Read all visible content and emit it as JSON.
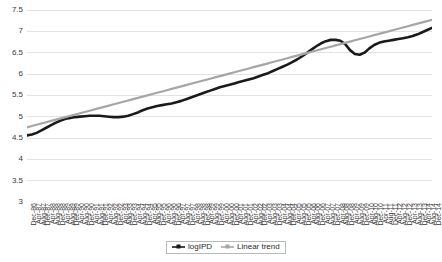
{
  "chart_data": {
    "type": "line",
    "title": "",
    "xlabel": "",
    "ylabel": "",
    "ylim": [
      3,
      7.5
    ],
    "y_ticks": [
      "3",
      "3.5",
      "4",
      "4.5",
      "5",
      "5.5",
      "6",
      "6.5",
      "7",
      "7.5"
    ],
    "y_tick_values": [
      3,
      3.5,
      4,
      4.5,
      5,
      5.5,
      6,
      6.5,
      7,
      7.5
    ],
    "grid": true,
    "legend_position": "bottom",
    "colors": {
      "logIPD": "#1a1a1a",
      "linear_trend": "#a6a6a6",
      "gridline": "#e2e2e2",
      "axis_text": "#3a3a3a"
    },
    "categories": [
      "Dec-86",
      "Apr-87",
      "Aug-87",
      "Dec-87",
      "Apr-88",
      "Aug-88",
      "Dec-88",
      "Apr-89",
      "Aug-89",
      "Dec-89",
      "Apr-90",
      "Aug-90",
      "Dec-90",
      "Apr-91",
      "Aug-91",
      "Dec-91",
      "Apr-92",
      "Aug-92",
      "Dec-92",
      "Apr-93",
      "Aug-93",
      "Dec-93",
      "Apr-94",
      "Aug-94",
      "Dec-94",
      "Apr-95",
      "Aug-95",
      "Dec-95",
      "Apr-96",
      "Aug-96",
      "Dec-96",
      "Apr-97",
      "Aug-97",
      "Dec-97",
      "Apr-98",
      "Aug-98",
      "Dec-98",
      "Apr-99",
      "Aug-99",
      "Dec-99",
      "Apr-00",
      "Aug-00",
      "Dec-00",
      "Apr-01",
      "Aug-01",
      "Dec-01",
      "Apr-02",
      "Aug-02",
      "Dec-02",
      "Apr-03",
      "Aug-03",
      "Dec-03",
      "Apr-04",
      "Aug-04",
      "Dec-04",
      "Apr-05",
      "Aug-05",
      "Dec-05",
      "Apr-06",
      "Aug-06",
      "Dec-06",
      "Apr-07",
      "Aug-07",
      "Dec-07",
      "Apr-08",
      "Aug-08",
      "Dec-08",
      "Apr-09",
      "Aug-09",
      "Dec-09",
      "Apr-10",
      "Aug-10",
      "Dec-10",
      "Apr-11",
      "Aug-11",
      "Dec-11",
      "Apr-12",
      "Aug-12",
      "Dec-12",
      "Apr-13",
      "Aug-13",
      "Dec-13",
      "Apr-14",
      "Aug-14",
      "Dec-14"
    ],
    "x_tick_labels": [
      "Dec-86",
      "Aug-87",
      "Apr-88",
      "Dec-88",
      "Aug-89",
      "Apr-90",
      "Dec-90",
      "Aug-91",
      "Apr-92",
      "Dec-92",
      "Aug-93",
      "Apr-94",
      "Dec-94",
      "Aug-95",
      "Apr-96",
      "Dec-96",
      "Aug-97",
      "Apr-98",
      "Dec-98",
      "Aug-99",
      "Apr-00",
      "Dec-00",
      "Aug-01",
      "Apr-02",
      "Dec-02",
      "Aug-03",
      "Apr-04",
      "Dec-04",
      "Aug-05",
      "Apr-06",
      "Dec-06",
      "Aug-07",
      "Apr-08",
      "Dec-08",
      "Aug-09",
      "Apr-10",
      "Dec-10",
      "Aug-11",
      "Apr-12",
      "Dec-12",
      "Aug-13",
      "Apr-14",
      "Dec-14"
    ],
    "series": [
      {
        "name": "logIPD",
        "color": "#1a1a1a",
        "values": [
          4.56,
          4.58,
          4.62,
          4.68,
          4.74,
          4.8,
          4.86,
          4.91,
          4.95,
          4.97,
          4.99,
          5.0,
          5.01,
          5.02,
          5.02,
          5.02,
          5.01,
          5.0,
          4.99,
          4.99,
          5.0,
          5.02,
          5.06,
          5.1,
          5.15,
          5.19,
          5.22,
          5.25,
          5.27,
          5.29,
          5.31,
          5.34,
          5.37,
          5.41,
          5.45,
          5.49,
          5.53,
          5.57,
          5.61,
          5.65,
          5.69,
          5.72,
          5.75,
          5.78,
          5.81,
          5.84,
          5.87,
          5.9,
          5.94,
          5.98,
          6.02,
          6.07,
          6.12,
          6.17,
          6.22,
          6.28,
          6.34,
          6.41,
          6.49,
          6.57,
          6.65,
          6.72,
          6.77,
          6.8,
          6.8,
          6.78,
          6.7,
          6.56,
          6.47,
          6.45,
          6.5,
          6.6,
          6.68,
          6.73,
          6.76,
          6.78,
          6.8,
          6.82,
          6.84,
          6.86,
          6.89,
          6.93,
          6.98,
          7.03,
          7.08
        ]
      },
      {
        "name": "Linear trend",
        "color": "#a6a6a6",
        "values": [
          4.75,
          4.78,
          4.81,
          4.84,
          4.87,
          4.9,
          4.93,
          4.96,
          4.99,
          5.02,
          5.05,
          5.08,
          5.11,
          5.14,
          5.17,
          5.2,
          5.23,
          5.26,
          5.29,
          5.32,
          5.35,
          5.38,
          5.41,
          5.44,
          5.47,
          5.5,
          5.53,
          5.56,
          5.59,
          5.62,
          5.65,
          5.68,
          5.71,
          5.74,
          5.77,
          5.8,
          5.83,
          5.86,
          5.89,
          5.92,
          5.95,
          5.98,
          6.01,
          6.04,
          6.07,
          6.1,
          6.13,
          6.16,
          6.19,
          6.22,
          6.25,
          6.28,
          6.31,
          6.34,
          6.37,
          6.4,
          6.43,
          6.46,
          6.49,
          6.52,
          6.55,
          6.58,
          6.61,
          6.64,
          6.67,
          6.7,
          6.73,
          6.76,
          6.79,
          6.82,
          6.85,
          6.88,
          6.91,
          6.94,
          6.97,
          7.0,
          7.03,
          7.06,
          7.09,
          7.12,
          7.15,
          7.18,
          7.21,
          7.24,
          7.27
        ]
      }
    ]
  },
  "legend": {
    "entries": [
      {
        "label": "logIPD",
        "marker": "line-marker",
        "color": "#1a1a1a"
      },
      {
        "label": "Linear trend",
        "marker": "line-marker",
        "color": "#a6a6a6"
      }
    ]
  }
}
